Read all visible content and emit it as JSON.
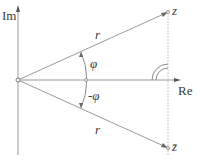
{
  "diagram": {
    "axes": {
      "imaginary_label": "Im",
      "real_label": "Re"
    },
    "points": {
      "z_label": "z",
      "zbar_label": "z̄"
    },
    "moduli": {
      "upper_r_label": "r",
      "lower_r_label": "r"
    },
    "angles": {
      "upper_angle_label": "φ",
      "lower_angle_label": "-φ"
    },
    "colors": {
      "line": "#9a9a9a",
      "text": "#3a3a3a",
      "background": "#ffffff"
    }
  }
}
